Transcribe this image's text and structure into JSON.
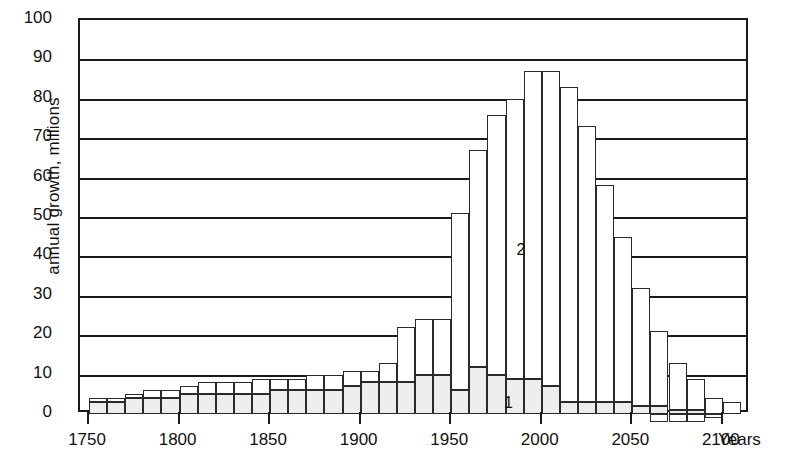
{
  "chart_data": {
    "type": "bar",
    "stacked": true,
    "title": "",
    "xlabel": "Years",
    "ylabel": "annual growth, millions",
    "ylim": [
      0,
      100
    ],
    "ytick_labels": [
      "0",
      "10",
      "20",
      "30",
      "40",
      "50",
      "60",
      "70",
      "80",
      "90",
      "100"
    ],
    "ytick_values": [
      0,
      10,
      20,
      30,
      40,
      50,
      60,
      70,
      80,
      90,
      100
    ],
    "xtick_labels": [
      "1750",
      "1800",
      "1850",
      "1900",
      "1950",
      "2000",
      "2050",
      "2100"
    ],
    "xtick_values": [
      1750,
      1800,
      1850,
      1900,
      1950,
      2000,
      2050,
      2100
    ],
    "xlim": [
      1745,
      2115
    ],
    "grid": true,
    "legend_position": "inline-annotation",
    "categories": [
      1750,
      1760,
      1770,
      1780,
      1790,
      1800,
      1810,
      1820,
      1830,
      1840,
      1850,
      1860,
      1870,
      1880,
      1890,
      1900,
      1910,
      1920,
      1930,
      1940,
      1950,
      1960,
      1970,
      1980,
      1990,
      2000,
      2010,
      2020,
      2030,
      2040,
      2050,
      2060,
      2070,
      2080,
      2090,
      2100
    ],
    "series": [
      {
        "name": "1",
        "label": "1",
        "description": "lower shaded segment",
        "values": [
          3,
          3,
          4,
          4,
          4,
          5,
          5,
          5,
          5,
          5,
          6,
          6,
          6,
          6,
          7,
          8,
          8,
          8,
          10,
          10,
          6,
          12,
          10,
          9,
          9,
          7,
          3,
          3,
          3,
          3,
          2,
          2,
          1,
          1,
          0,
          0
        ]
      },
      {
        "name": "2",
        "label": "2",
        "description": "upper white segment",
        "values": [
          1,
          1,
          1,
          2,
          2,
          2,
          3,
          3,
          3,
          4,
          3,
          3,
          4,
          4,
          4,
          3,
          5,
          14,
          14,
          14,
          45,
          55,
          66,
          71,
          78,
          80,
          80,
          70,
          55,
          42,
          30,
          19,
          12,
          8,
          4,
          3
        ]
      }
    ],
    "totals": [
      4,
      4,
      5,
      6,
      6,
      7,
      8,
      8,
      8,
      9,
      9,
      9,
      10,
      10,
      11,
      11,
      13,
      22,
      24,
      24,
      51,
      67,
      76,
      80,
      87,
      87,
      83,
      73,
      58,
      45,
      32,
      21,
      13,
      9,
      4,
      3
    ],
    "negative_values": [
      0,
      0,
      0,
      0,
      0,
      0,
      0,
      0,
      0,
      0,
      0,
      0,
      0,
      0,
      0,
      0,
      0,
      0,
      0,
      0,
      0,
      0,
      0,
      0,
      0,
      0,
      0,
      0,
      0,
      0,
      0,
      -2,
      -2,
      -2,
      -1,
      0
    ],
    "annotations": [
      {
        "text": "2",
        "x": 1985,
        "y": 42,
        "note": "upper series label"
      },
      {
        "text": "1",
        "x": 1978,
        "y": 3,
        "note": "lower series label"
      }
    ]
  }
}
